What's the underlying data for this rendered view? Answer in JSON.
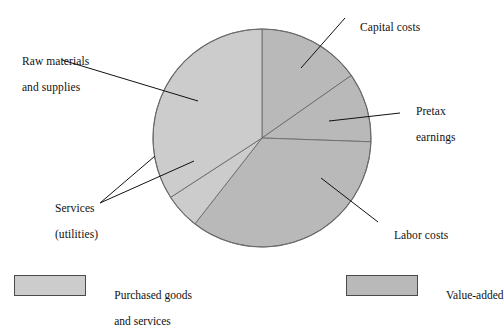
{
  "title": "",
  "colors": {
    "purchased": "#cccccc",
    "value_added": "#b9b9b9",
    "outline": "#6b6b6b",
    "leader": "#111111",
    "background": "#ffffff"
  },
  "chart_data": {
    "type": "pie",
    "title": "",
    "xlabel": "",
    "ylabel": "",
    "legend_position": "bottom",
    "grid": false,
    "categories": [
      "Capital costs",
      "Pretax earnings",
      "Labor costs",
      "Services (utilities)",
      "Raw materials and supplies"
    ],
    "values": [
      15,
      10,
      35,
      5,
      35
    ],
    "slices": [
      {
        "label": "Capital costs",
        "group": "Value-added",
        "value": 15,
        "start_angle_deg": 0,
        "end_angle_deg": 55,
        "color": "#b9b9b9"
      },
      {
        "label": "Pretax earnings",
        "group": "Value-added",
        "value": 10,
        "start_angle_deg": 55,
        "end_angle_deg": 92,
        "color": "#b9b9b9"
      },
      {
        "label": "Labor costs",
        "group": "Value-added",
        "value": 35,
        "start_angle_deg": 92,
        "end_angle_deg": 218,
        "color": "#b9b9b9"
      },
      {
        "label": "Services (utilities)",
        "group": "Purchased goods and services",
        "value": 5,
        "start_angle_deg": 218,
        "end_angle_deg": 237,
        "color": "#cccccc"
      },
      {
        "label": "Raw materials and supplies",
        "group": "Purchased goods and services",
        "value": 35,
        "start_angle_deg": 237,
        "end_angle_deg": 360,
        "color": "#cccccc"
      }
    ]
  },
  "labels": {
    "raw_materials_line1": "Raw materials",
    "raw_materials_line2": "and supplies",
    "capital_costs": "Capital costs",
    "pretax_line1": "Pretax",
    "pretax_line2": "earnings",
    "labor_costs": "Labor costs",
    "services_line1": "Services",
    "services_line2": "(utilities)"
  },
  "legend": {
    "items": [
      {
        "label_line1": "Purchased goods",
        "label_line2": "and services",
        "color": "#cccccc"
      },
      {
        "label_line1": "Value-added",
        "label_line2": "",
        "color": "#b9b9b9"
      }
    ]
  }
}
